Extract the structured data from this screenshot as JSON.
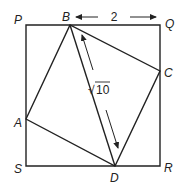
{
  "diagram": {
    "type": "geometry",
    "colors": {
      "stroke": "#222222",
      "background": "#ffffff"
    },
    "points": {
      "P": {
        "label": "P",
        "x": 26,
        "y": 25
      },
      "Q": {
        "label": "Q",
        "x": 160,
        "y": 25
      },
      "R": {
        "label": "R",
        "x": 160,
        "y": 166
      },
      "S": {
        "label": "S",
        "x": 26,
        "y": 166
      },
      "A": {
        "label": "A",
        "x": 26,
        "y": 119
      },
      "B": {
        "label": "B",
        "x": 70,
        "y": 25
      },
      "C": {
        "label": "C",
        "x": 160,
        "y": 71
      },
      "D": {
        "label": "D",
        "x": 115,
        "y": 166
      }
    },
    "segments": [
      [
        "P",
        "Q"
      ],
      [
        "Q",
        "R"
      ],
      [
        "R",
        "S"
      ],
      [
        "S",
        "P"
      ],
      [
        "A",
        "B"
      ],
      [
        "B",
        "C"
      ],
      [
        "C",
        "D"
      ],
      [
        "D",
        "A"
      ],
      [
        "B",
        "D"
      ]
    ],
    "measurements": {
      "BQ": {
        "label": "2"
      },
      "BD": {
        "label": "√10",
        "radicand": "10",
        "radical": "√"
      }
    }
  }
}
